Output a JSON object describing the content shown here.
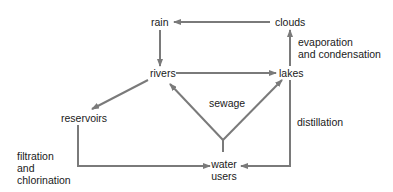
{
  "diagram": {
    "nodes": {
      "rain": "rain",
      "clouds": "clouds",
      "rivers": "rivers",
      "lakes": "lakes",
      "reservoirs": "reservoirs",
      "water_users_line1": "water",
      "water_users_line2": "users"
    },
    "edge_labels": {
      "evaporation_line1": "evaporation",
      "evaporation_line2": "and condensation",
      "sewage": "sewage",
      "distillation": "distillation",
      "filtration_line1": "filtration",
      "filtration_line2": "and",
      "filtration_line3": "chlorination"
    },
    "edges": [
      {
        "from": "clouds",
        "to": "rain"
      },
      {
        "from": "rain",
        "to": "rivers"
      },
      {
        "from": "rivers",
        "to": "lakes"
      },
      {
        "from": "lakes",
        "to": "clouds",
        "label": "evaporation and condensation"
      },
      {
        "from": "rivers",
        "to": "reservoirs"
      },
      {
        "from": "reservoirs",
        "to": "water users",
        "label": "filtration and chlorination"
      },
      {
        "from": "water users",
        "to": "rivers",
        "label": "sewage"
      },
      {
        "from": "water users",
        "to": "lakes",
        "label": "sewage"
      },
      {
        "from": "lakes",
        "to": "water users",
        "label": "distillation"
      }
    ],
    "colors": {
      "arrow": "#7a7a7a",
      "text": "#1a1a1a"
    }
  }
}
